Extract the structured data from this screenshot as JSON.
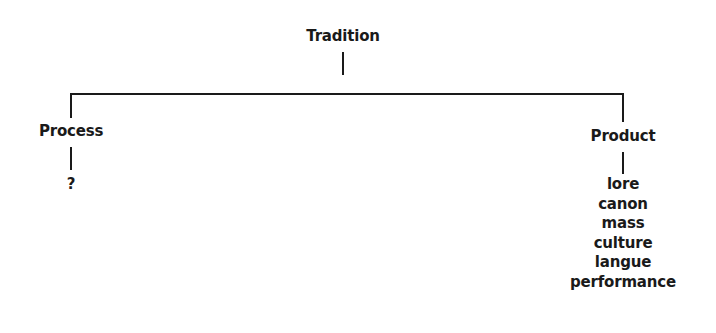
{
  "diagram": {
    "type": "tree",
    "root": {
      "label": "Tradition"
    },
    "branches": [
      {
        "label": "Process",
        "children": [
          "?"
        ]
      },
      {
        "label": "Product",
        "children": [
          "lore",
          "canon",
          "mass",
          "culture",
          "langue",
          "performance"
        ]
      }
    ],
    "colors": {
      "text": "#1a1a1a",
      "lines": "#1a1a1a",
      "background": "#ffffff"
    }
  }
}
